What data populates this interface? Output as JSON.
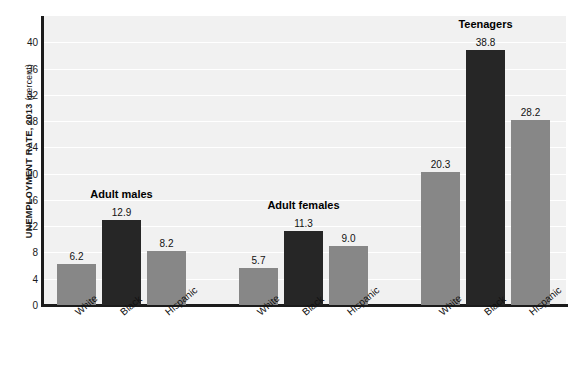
{
  "chart_data": {
    "type": "bar",
    "title": "",
    "xlabel": "",
    "ylabel": "UNEMPLOYMENT RATE, 2013",
    "ylabel_unit": "(percent)",
    "ylim": [
      0,
      44
    ],
    "yticks": [
      0,
      4,
      8,
      12,
      16,
      20,
      24,
      28,
      32,
      36,
      40
    ],
    "grid": true,
    "legend_position": "none",
    "group_labels": [
      "Adult males",
      "Adult females",
      "Teenagers"
    ],
    "categories": [
      "White",
      "Black",
      "Hispanic",
      "White",
      "Black",
      "Hispanic",
      "White",
      "Black",
      "Hispanic",
      "National average"
    ],
    "values": [
      6.2,
      12.9,
      8.2,
      5.7,
      11.3,
      9.0,
      20.3,
      38.8,
      28.2,
      7.4
    ],
    "groups": [
      {
        "name": "Adult males",
        "bars": [
          {
            "label": "White",
            "value": 6.2,
            "value_text": "6.2",
            "color": "#878787",
            "style": "gray"
          },
          {
            "label": "Black",
            "value": 12.9,
            "value_text": "12.9",
            "color": "#262626",
            "style": "dark"
          },
          {
            "label": "Hispanic",
            "value": 8.2,
            "value_text": "8.2",
            "color": "#878787",
            "style": "gray"
          }
        ]
      },
      {
        "name": "Adult females",
        "bars": [
          {
            "label": "White",
            "value": 5.7,
            "value_text": "5.7",
            "color": "#878787",
            "style": "gray"
          },
          {
            "label": "Black",
            "value": 11.3,
            "value_text": "11.3",
            "color": "#262626",
            "style": "dark"
          },
          {
            "label": "Hispanic",
            "value": 9.0,
            "value_text": "9.0",
            "color": "#878787",
            "style": "gray"
          }
        ]
      },
      {
        "name": "Teenagers",
        "bars": [
          {
            "label": "White",
            "value": 20.3,
            "value_text": "20.3",
            "color": "#878787",
            "style": "gray"
          },
          {
            "label": "Black",
            "value": 38.8,
            "value_text": "38.8",
            "color": "#262626",
            "style": "dark"
          },
          {
            "label": "Hispanic",
            "value": 28.2,
            "value_text": "28.2",
            "color": "#878787",
            "style": "gray"
          }
        ]
      },
      {
        "name": "",
        "bars": [
          {
            "label": "National average",
            "label_line1": "National",
            "label_line2": "average",
            "value": 7.4,
            "value_text": "7.4",
            "color": "#262626",
            "style": "dark",
            "bold_label": true
          }
        ]
      }
    ],
    "colors": {
      "gray_bar": "#878787",
      "dark_bar": "#262626",
      "plot_background": "#f1f1f1",
      "gridline": "#ffffff",
      "axis": "#1b1b1b",
      "text": "#111111"
    }
  }
}
